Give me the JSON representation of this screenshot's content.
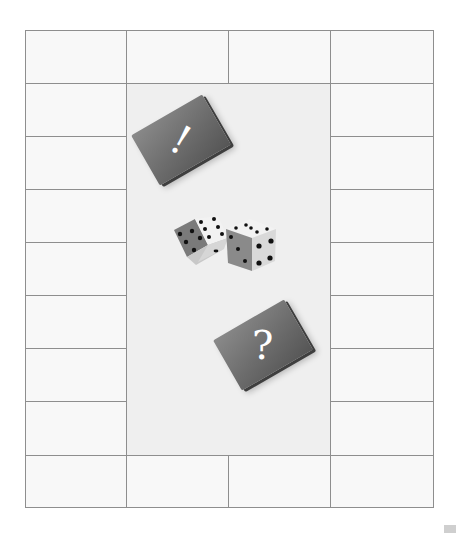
{
  "board": {
    "layout": "4 columns x 9 rows perimeter",
    "border_color": "#8e8e8e",
    "cell_color": "#f8f8f8",
    "center_color": "#efefef",
    "top_row_cells": 4,
    "bottom_row_cells": 4,
    "left_column_cells": 7,
    "right_column_cells": 7
  },
  "cards": [
    {
      "name": "chance-card",
      "symbol": "!",
      "rotation_deg": -30,
      "color": "#6c6c6c"
    },
    {
      "name": "question-card",
      "symbol": "?",
      "rotation_deg": -30,
      "color": "#6c6c6c"
    }
  ],
  "dice": [
    {
      "name": "die-left",
      "visible_faces": {
        "top": 6,
        "left": 5,
        "right": 2
      }
    },
    {
      "name": "die-right",
      "visible_faces": {
        "top": 5,
        "left": 3,
        "right": 4
      }
    }
  ]
}
